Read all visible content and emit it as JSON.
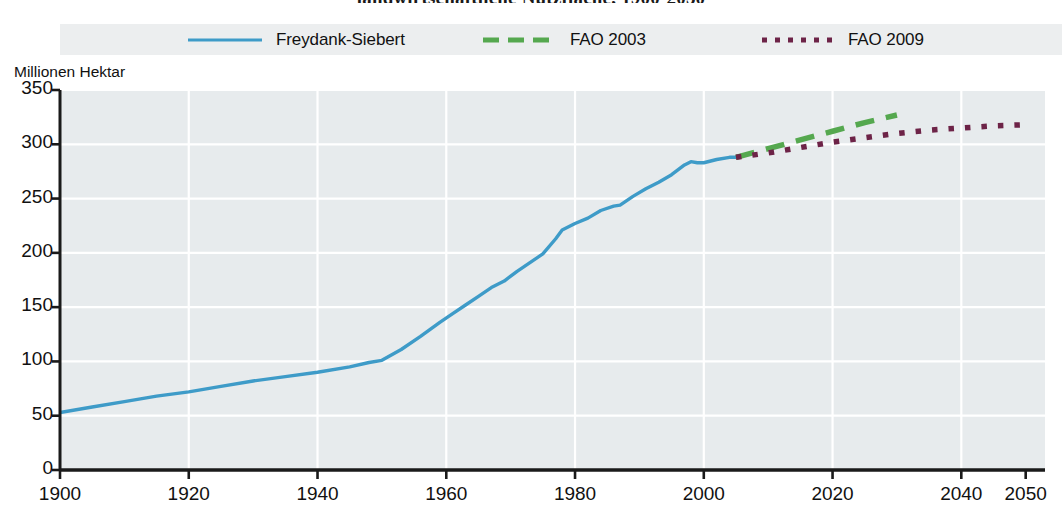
{
  "title": "landwirtschaftliche Nutzfläche, 1900-2050",
  "axis": {
    "y_title": "Millionen Hektar",
    "y_ticks": [
      "0",
      "50",
      "100",
      "150",
      "200",
      "250",
      "300",
      "350"
    ],
    "x_ticks": [
      "1900",
      "1920",
      "1940",
      "1960",
      "1980",
      "2000",
      "2020",
      "2040",
      "2050"
    ]
  },
  "legend": {
    "items": [
      {
        "label": "Freydank-Siebert",
        "style": "solid",
        "color": "#3e9bc8",
        "icon": "solid-line-icon"
      },
      {
        "label": "FAO 2003",
        "style": "dashed",
        "color": "#55a84f",
        "icon": "dashed-line-icon"
      },
      {
        "label": "FAO 2009",
        "style": "dotted",
        "color": "#6d2347",
        "icon": "dotted-line-icon"
      }
    ]
  },
  "colors": {
    "plot_background": "#e7ebed",
    "grid": "#ffffff",
    "axis": "#1a1a1a",
    "legend_background": "#eceeef",
    "series_historical": "#3e9bc8",
    "series_fao2003": "#55a84f",
    "series_fao2009": "#6d2347"
  },
  "chart_data": {
    "type": "line",
    "title": "landwirtschaftliche Nutzfläche, 1900-2050",
    "xlabel": "",
    "ylabel": "Millionen Hektar",
    "xlim": [
      1900,
      2053
    ],
    "ylim": [
      0,
      350
    ],
    "grid": true,
    "legend_position": "top",
    "xticks": [
      1900,
      1920,
      1940,
      1960,
      1980,
      2000,
      2020,
      2040,
      2050
    ],
    "yticks": [
      0,
      50,
      100,
      150,
      200,
      250,
      300,
      350
    ],
    "series": [
      {
        "name": "Freydank-Siebert",
        "style": "solid",
        "color": "#3e9bc8",
        "x": [
          1900,
          1905,
          1910,
          1915,
          1920,
          1925,
          1930,
          1935,
          1940,
          1945,
          1948,
          1950,
          1953,
          1956,
          1959,
          1961,
          1963,
          1965,
          1967,
          1969,
          1971,
          1973,
          1975,
          1977,
          1978,
          1980,
          1982,
          1984,
          1986,
          1987,
          1989,
          1991,
          1993,
          1995,
          1997,
          1998,
          1999,
          2000,
          2002,
          2004,
          2005
        ],
        "y": [
          53,
          58,
          63,
          68,
          72,
          77,
          82,
          86,
          90,
          95,
          99,
          101,
          111,
          123,
          136,
          144,
          152,
          160,
          168,
          174,
          183,
          191,
          199,
          213,
          221,
          227,
          232,
          239,
          243,
          244,
          252,
          259,
          265,
          272,
          281,
          284,
          283,
          283,
          286,
          288,
          288
        ]
      },
      {
        "name": "FAO 2003",
        "style": "dashed",
        "color": "#55a84f",
        "x": [
          2005,
          2010,
          2015,
          2020,
          2025,
          2030
        ],
        "y": [
          288,
          296,
          304,
          312,
          320,
          327
        ]
      },
      {
        "name": "FAO 2009",
        "style": "dotted",
        "color": "#6d2347",
        "x": [
          2005,
          2010,
          2015,
          2020,
          2025,
          2030,
          2035,
          2040,
          2045,
          2050
        ],
        "y": [
          288,
          292,
          297,
          302,
          306,
          310,
          313,
          315,
          317,
          318
        ]
      }
    ]
  }
}
